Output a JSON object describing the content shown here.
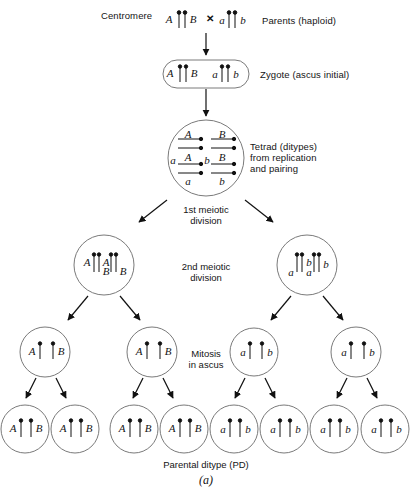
{
  "figure": {
    "caption_bottom": "Parental ditype (PD)",
    "figure_letter": "(a)",
    "ink": "#111111",
    "outline": "#7a7a7a"
  },
  "annotations": {
    "centromere": "Centromere",
    "parents": "Parents (haploid)",
    "zygote": "Zygote (ascus initial)",
    "tetrad_line1": "Tetrad (ditypes)",
    "tetrad_line2": "from replication",
    "tetrad_line3": "and pairing",
    "first_division_line1": "1st meiotic",
    "first_division_line2": "division",
    "second_division_line1": "2nd meiotic",
    "second_division_line2": "division",
    "mitosis_line1": "Mitosis",
    "mitosis_line2": "in ascus"
  },
  "stages": {
    "parents": {
      "cross_symbol": "✕",
      "left_alleles": [
        "A",
        "B"
      ],
      "right_alleles": [
        "a",
        "b"
      ]
    },
    "zygote": {
      "alleles": [
        "A",
        "B",
        "a",
        "b"
      ]
    },
    "tetrad": {
      "rows_left": [
        "A",
        "A",
        "a",
        "a"
      ],
      "rows_right": [
        "B",
        "B",
        "b",
        "b"
      ]
    },
    "meiosis1": [
      {
        "id": "left",
        "alleles": [
          "A",
          "A",
          "B",
          "B"
        ]
      },
      {
        "id": "right",
        "alleles": [
          "a",
          "a",
          "b",
          "b"
        ]
      }
    ],
    "meiosis2": [
      {
        "id": "m2-1",
        "alleles": [
          "A",
          "B"
        ]
      },
      {
        "id": "m2-2",
        "alleles": [
          "A",
          "B"
        ]
      },
      {
        "id": "m2-3",
        "alleles": [
          "a",
          "b"
        ]
      },
      {
        "id": "m2-4",
        "alleles": [
          "a",
          "b"
        ]
      }
    ],
    "ascospores": [
      {
        "id": "sp-1",
        "alleles": [
          "A",
          "B"
        ]
      },
      {
        "id": "sp-2",
        "alleles": [
          "A",
          "B"
        ]
      },
      {
        "id": "sp-3",
        "alleles": [
          "A",
          "B"
        ]
      },
      {
        "id": "sp-4",
        "alleles": [
          "A",
          "B"
        ]
      },
      {
        "id": "sp-5",
        "alleles": [
          "a",
          "b"
        ]
      },
      {
        "id": "sp-6",
        "alleles": [
          "a",
          "b"
        ]
      },
      {
        "id": "sp-7",
        "alleles": [
          "a",
          "b"
        ]
      },
      {
        "id": "sp-8",
        "alleles": [
          "a",
          "b"
        ]
      }
    ]
  }
}
